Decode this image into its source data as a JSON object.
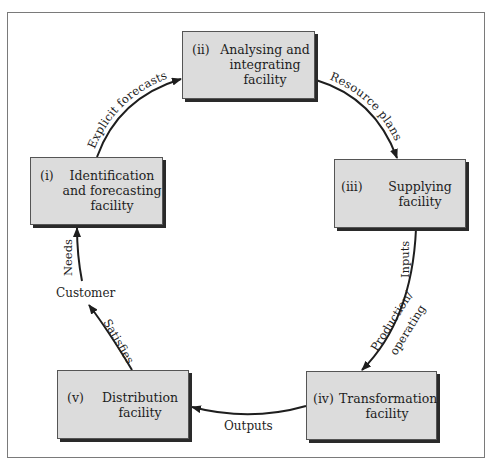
{
  "diagram": {
    "type": "cycle",
    "nodes": [
      {
        "id": "i",
        "number": "(i)",
        "lines": [
          "Identification",
          "and forecasting",
          "facility"
        ]
      },
      {
        "id": "ii",
        "number": "(ii)",
        "lines": [
          "Analysing and",
          "integrating",
          "facility"
        ]
      },
      {
        "id": "iii",
        "number": "(iii)",
        "lines": [
          "Supplying",
          "facility"
        ]
      },
      {
        "id": "iv",
        "number": "(iv)",
        "lines": [
          "Transformation",
          "facility"
        ]
      },
      {
        "id": "v",
        "number": "(v)",
        "lines": [
          "Distribution",
          "facility"
        ]
      }
    ],
    "customer_label": "Customer",
    "edges": [
      {
        "from": "i",
        "to": "ii",
        "label": "Explicit forecasts"
      },
      {
        "from": "ii",
        "to": "iii",
        "label": "Resource plans"
      },
      {
        "from": "iii",
        "to": "iv",
        "label": "Inputs",
        "label2": "Production/",
        "label3": "operating"
      },
      {
        "from": "iv",
        "to": "v",
        "label": "Outputs"
      },
      {
        "from": "v",
        "to": "customer",
        "label": "Satisfies"
      },
      {
        "from": "customer",
        "to": "i",
        "label": "Needs"
      }
    ],
    "colors": {
      "box_fill": "#dcdcdc",
      "box_border": "#555555",
      "shadow": "#2a2a2a",
      "arrow": "#1e1e1e",
      "frame": "#7a7a7a"
    }
  }
}
